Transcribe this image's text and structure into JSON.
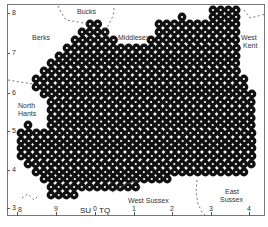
{
  "map": {
    "regions": {
      "bucks": "Bucks",
      "berks": "Berks",
      "middlesex": "Middlesex",
      "west_kent_1": "West",
      "west_kent_2": "Kent",
      "north_hants_1": "North",
      "north_hants_2": "Hants",
      "west_sussex": "West Sussex",
      "east_sussex_1": "East",
      "east_sussex_2": "Sussex"
    },
    "y_axis_ticks": [
      "8",
      "7",
      "6",
      "5",
      "4",
      "3"
    ],
    "x_axis_ticks": [
      "8",
      "9",
      "0",
      "1",
      "2",
      "3",
      "4"
    ],
    "grid_squares": {
      "left": "SU",
      "right": "TQ"
    },
    "dot_color": "#111111",
    "dot_center_color": "#ffffff",
    "dot_rows": [
      {
        "y": 10,
        "runs": [
          [
            213,
            240
          ]
        ]
      },
      {
        "y": 17,
        "runs": [
          [
            182,
            182
          ],
          [
            213,
            240
          ]
        ]
      },
      {
        "y": 24,
        "runs": [
          [
            90,
            98
          ],
          [
            159,
            240
          ]
        ]
      },
      {
        "y": 32,
        "runs": [
          [
            82,
            106
          ],
          [
            159,
            240
          ]
        ]
      },
      {
        "y": 40,
        "runs": [
          [
            75,
            114
          ],
          [
            151,
            240
          ]
        ]
      },
      {
        "y": 48,
        "runs": [
          [
            67,
            240
          ]
        ]
      },
      {
        "y": 56,
        "runs": [
          [
            59,
            240
          ]
        ]
      },
      {
        "y": 63,
        "runs": [
          [
            51,
            240
          ]
        ]
      },
      {
        "y": 71,
        "runs": [
          [
            44,
            240
          ]
        ]
      },
      {
        "y": 79,
        "runs": [
          [
            36,
            248
          ]
        ]
      },
      {
        "y": 87,
        "runs": [
          [
            36,
            248
          ]
        ]
      },
      {
        "y": 94,
        "runs": [
          [
            44,
            255
          ]
        ]
      },
      {
        "y": 102,
        "runs": [
          [
            51,
            255
          ]
        ]
      },
      {
        "y": 110,
        "runs": [
          [
            51,
            255
          ]
        ]
      },
      {
        "y": 118,
        "runs": [
          [
            51,
            255
          ]
        ]
      },
      {
        "y": 125,
        "runs": [
          [
            28,
            28
          ],
          [
            51,
            255
          ]
        ]
      },
      {
        "y": 133,
        "runs": [
          [
            21,
            255
          ]
        ]
      },
      {
        "y": 141,
        "runs": [
          [
            21,
            255
          ]
        ]
      },
      {
        "y": 148,
        "runs": [
          [
            21,
            255
          ]
        ]
      },
      {
        "y": 156,
        "runs": [
          [
            21,
            255
          ]
        ]
      },
      {
        "y": 164,
        "runs": [
          [
            28,
            255
          ]
        ]
      },
      {
        "y": 172,
        "runs": [
          [
            36,
            248
          ]
        ]
      },
      {
        "y": 179,
        "runs": [
          [
            44,
            172
          ]
        ]
      },
      {
        "y": 187,
        "runs": [
          [
            51,
            140
          ]
        ]
      },
      {
        "y": 195,
        "runs": [
          [
            51,
            75
          ]
        ]
      }
    ]
  }
}
